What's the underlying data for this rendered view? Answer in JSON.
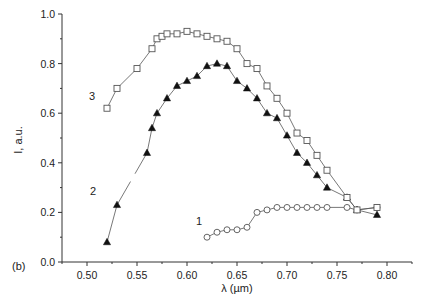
{
  "chart_data": {
    "type": "line",
    "title": "",
    "panel_label": "(b)",
    "xlabel": "λ (µm)",
    "ylabel": "I, a.u.",
    "xlim": [
      0.475,
      0.825
    ],
    "ylim": [
      0.0,
      1.0
    ],
    "x_ticks": [
      0.5,
      0.55,
      0.6,
      0.65,
      0.7,
      0.75,
      0.8
    ],
    "x_tick_labels": [
      "0.50",
      "0.55",
      "0.60",
      "0.65",
      "0.70",
      "0.75",
      "0.80"
    ],
    "y_ticks": [
      0.0,
      0.2,
      0.4,
      0.6,
      0.8,
      1.0
    ],
    "y_tick_labels": [
      "0.0",
      "0.2",
      "0.4",
      "0.6",
      "0.8",
      "1.0"
    ],
    "grid": false,
    "legend": "inline curve labels",
    "series": [
      {
        "name": "1",
        "marker": "open-circle",
        "label_pos": [
          0.612,
          0.15
        ],
        "x": [
          0.62,
          0.63,
          0.64,
          0.65,
          0.66,
          0.67,
          0.68,
          0.69,
          0.7,
          0.71,
          0.72,
          0.73,
          0.74,
          0.76,
          0.77,
          0.79
        ],
        "y": [
          0.1,
          0.12,
          0.13,
          0.13,
          0.14,
          0.2,
          0.21,
          0.22,
          0.22,
          0.22,
          0.22,
          0.22,
          0.22,
          0.22,
          0.21,
          0.22
        ]
      },
      {
        "name": "2",
        "marker": "filled-triangle",
        "label_pos": [
          0.506,
          0.27
        ],
        "gaps_after_index": [
          1
        ],
        "x": [
          0.52,
          0.53,
          0.56,
          0.565,
          0.57,
          0.58,
          0.59,
          0.6,
          0.61,
          0.62,
          0.63,
          0.64,
          0.65,
          0.66,
          0.67,
          0.68,
          0.69,
          0.7,
          0.71,
          0.72,
          0.73,
          0.74,
          0.76,
          0.77,
          0.79
        ],
        "y": [
          0.08,
          0.23,
          0.44,
          0.54,
          0.6,
          0.66,
          0.71,
          0.73,
          0.75,
          0.79,
          0.8,
          0.79,
          0.73,
          0.7,
          0.66,
          0.6,
          0.58,
          0.51,
          0.44,
          0.4,
          0.35,
          0.3,
          0.26,
          0.21,
          0.19
        ]
      },
      {
        "name": "3",
        "marker": "open-square",
        "label_pos": [
          0.505,
          0.655
        ],
        "x": [
          0.52,
          0.53,
          0.55,
          0.565,
          0.57,
          0.575,
          0.58,
          0.59,
          0.6,
          0.61,
          0.62,
          0.63,
          0.64,
          0.65,
          0.66,
          0.67,
          0.68,
          0.69,
          0.7,
          0.71,
          0.72,
          0.73,
          0.74,
          0.76,
          0.77,
          0.79
        ],
        "y": [
          0.62,
          0.7,
          0.78,
          0.86,
          0.9,
          0.91,
          0.92,
          0.92,
          0.93,
          0.92,
          0.91,
          0.9,
          0.89,
          0.86,
          0.8,
          0.78,
          0.71,
          0.66,
          0.6,
          0.52,
          0.49,
          0.43,
          0.37,
          0.26,
          0.21,
          0.22
        ]
      }
    ]
  }
}
